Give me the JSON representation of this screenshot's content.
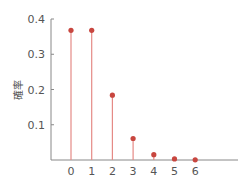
{
  "chart_data": {
    "type": "stem",
    "title": "",
    "xlabel": "",
    "ylabel": "確率",
    "categories": [
      "0",
      "1",
      "2",
      "3",
      "4",
      "5",
      "6"
    ],
    "x": [
      0,
      1,
      2,
      3,
      4,
      5,
      6
    ],
    "values": [
      0.368,
      0.368,
      0.184,
      0.061,
      0.015,
      0.003,
      0.0005
    ],
    "ylim": [
      0,
      0.4
    ],
    "yticks": [
      "0.1",
      "0.2",
      "0.3",
      "0.4"
    ],
    "ytick_values": [
      0.1,
      0.2,
      0.3,
      0.4
    ],
    "grid": false,
    "colors": {
      "stem": "#e58a86",
      "marker": "#c8463f",
      "axis": "#888888"
    }
  }
}
